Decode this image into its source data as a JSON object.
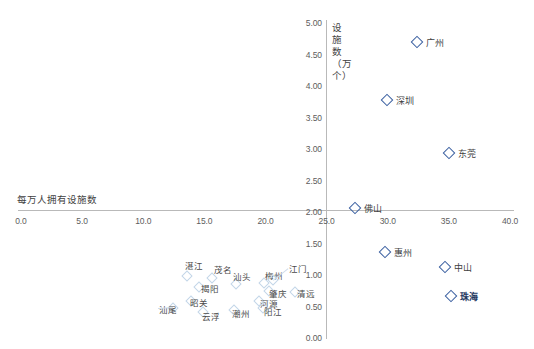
{
  "chart_data": {
    "type": "scatter",
    "title": "",
    "xlabel": "每万人拥有设施数",
    "ylabel": "设施数（万个）",
    "xlim": [
      0.0,
      40.0
    ],
    "ylim": [
      0.0,
      5.0
    ],
    "xticks": [
      "0.0",
      "5.0",
      "10.0",
      "15.0",
      "20.0",
      "25.0",
      "30.0",
      "35.0",
      "40.0"
    ],
    "xtick_values": [
      0.0,
      5.0,
      10.0,
      15.0,
      20.0,
      25.0,
      30.0,
      35.0,
      40.0
    ],
    "yticks": [
      "0.00",
      "0.50",
      "1.00",
      "1.50",
      "2.00",
      "2.50",
      "3.00",
      "3.50",
      "4.00",
      "4.50",
      "5.00"
    ],
    "ytick_values": [
      0.0,
      0.5,
      1.0,
      1.5,
      2.0,
      2.5,
      3.0,
      3.5,
      4.0,
      4.5,
      5.0
    ],
    "grid": false,
    "legend": "none",
    "axis_origin_x": 25.0,
    "axis_origin_y": 2.0,
    "marker_color": "#3a5fa0",
    "faint_marker_color": "#c3d6e8",
    "points": [
      {
        "name": "广州",
        "x": 32.4,
        "y": 4.7,
        "emphasis": "normal",
        "label_dx": 9,
        "label_dy": 0
      },
      {
        "name": "深圳",
        "x": 29.9,
        "y": 3.78,
        "emphasis": "normal",
        "label_dx": 9,
        "label_dy": 0
      },
      {
        "name": "东莞",
        "x": 35.0,
        "y": 2.93,
        "emphasis": "normal",
        "label_dx": 9,
        "label_dy": 0
      },
      {
        "name": "佛山",
        "x": 27.3,
        "y": 2.07,
        "emphasis": "normal",
        "label_dx": 9,
        "label_dy": 0
      },
      {
        "name": "惠州",
        "x": 29.8,
        "y": 1.37,
        "emphasis": "normal",
        "label_dx": 9,
        "label_dy": 0
      },
      {
        "name": "中山",
        "x": 34.7,
        "y": 1.13,
        "emphasis": "normal",
        "label_dx": 9,
        "label_dy": 0
      },
      {
        "name": "珠海",
        "x": 35.2,
        "y": 0.66,
        "emphasis": "bold",
        "label_dx": 9,
        "label_dy": 0
      }
    ],
    "cluster_points": [
      {
        "name": "湛江",
        "x": 13.6,
        "y": 0.99,
        "label_dx": -2,
        "label_dy": -11
      },
      {
        "name": "茂名",
        "x": 15.6,
        "y": 0.95,
        "label_dx": 2,
        "label_dy": -9
      },
      {
        "name": "汕头",
        "x": 17.6,
        "y": 0.86,
        "label_dx": -3,
        "label_dy": -8
      },
      {
        "name": "梅州",
        "x": 19.9,
        "y": 0.88,
        "label_dx": 1,
        "label_dy": -8
      },
      {
        "name": "江门",
        "x": 20.6,
        "y": 0.92,
        "label_dx": 16,
        "label_dy": -12
      },
      {
        "name": "揭阳",
        "x": 14.6,
        "y": 0.81,
        "label_dx": 2,
        "label_dy": 1
      },
      {
        "name": "肇庆",
        "x": 20.3,
        "y": 0.74,
        "label_dx": 0,
        "label_dy": 2
      },
      {
        "name": "清远",
        "x": 22.4,
        "y": 0.73,
        "label_dx": 2,
        "label_dy": 1
      },
      {
        "name": "昭关",
        "x": 13.9,
        "y": 0.58,
        "label_dx": -1,
        "label_dy": 1
      },
      {
        "name": "河源",
        "x": 19.5,
        "y": 0.59,
        "label_dx": 1,
        "label_dy": 2
      },
      {
        "name": "阳江",
        "x": 19.8,
        "y": 0.47,
        "label_dx": 1,
        "label_dy": 3
      },
      {
        "name": "汕尾",
        "x": 12.4,
        "y": 0.47,
        "label_dx": -14,
        "label_dy": 1
      },
      {
        "name": "潮州",
        "x": 17.4,
        "y": 0.45,
        "label_dx": -2,
        "label_dy": 3
      },
      {
        "name": "云浮",
        "x": 14.9,
        "y": 0.41,
        "label_dx": -1,
        "label_dy": 4
      }
    ]
  }
}
